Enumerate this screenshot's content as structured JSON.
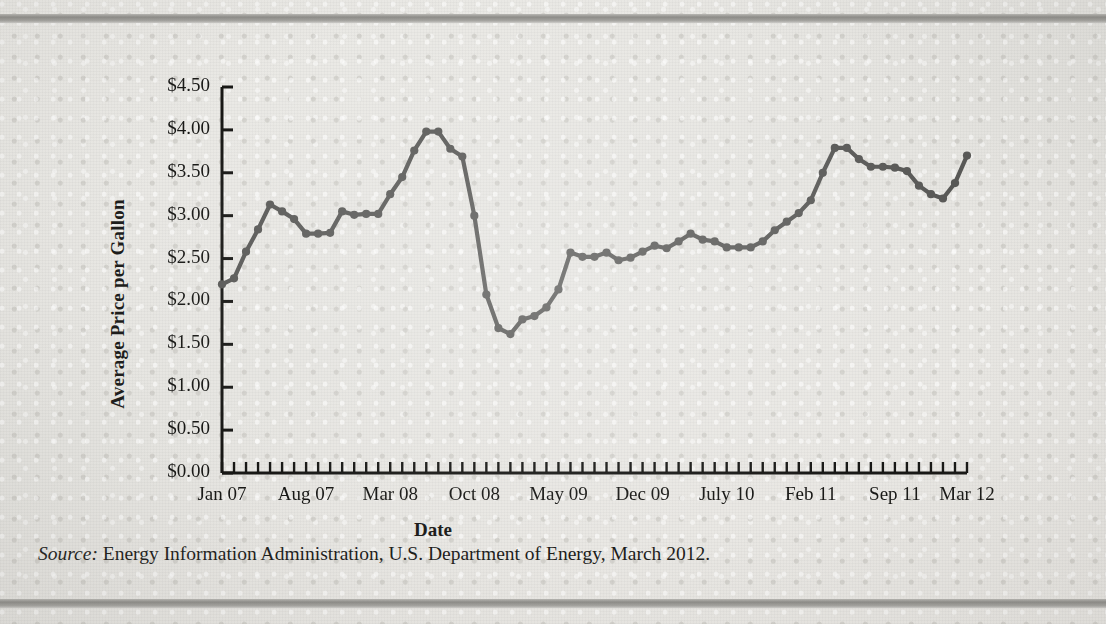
{
  "figure": {
    "ylabel": "Average Price per Gallon",
    "xlabel": "Date",
    "source_prefix": "Source:",
    "source_text": " Energy Information Administration, U.S. Department of Energy, March 2012."
  },
  "colors": {
    "paper": "#e9e8e4",
    "ink": "#1d1d1b",
    "series": "#5a5a58",
    "rule": "#8d8c88"
  },
  "chart_data": {
    "type": "line",
    "title": "",
    "xlabel": "Date",
    "ylabel": "Average Price per Gallon",
    "ylim": [
      0.0,
      4.5
    ],
    "ytick_labels": [
      "$0.00",
      "$0.50",
      "$1.00",
      "$1.50",
      "$2.00",
      "$2.50",
      "$3.00",
      "$3.50",
      "$4.00",
      "$4.50"
    ],
    "ytick_values": [
      0.0,
      0.5,
      1.0,
      1.5,
      2.0,
      2.5,
      3.0,
      3.5,
      4.0,
      4.5
    ],
    "xtick_labels": [
      "Jan 07",
      "Aug 07",
      "Mar 08",
      "Oct 08",
      "May 09",
      "Dec 09",
      "July 10",
      "Feb 11",
      "Sep 11",
      "Mar 12"
    ],
    "xtick_label_indices": [
      0,
      7,
      14,
      21,
      28,
      35,
      42,
      49,
      56,
      62
    ],
    "n_points": 63,
    "minor_ticks": true,
    "grid": false,
    "legend": "none",
    "markers": true,
    "x": [
      "Jan 07",
      "Feb 07",
      "Mar 07",
      "Apr 07",
      "May 07",
      "Jun 07",
      "July 07",
      "Aug 07",
      "Sep 07",
      "Oct 07",
      "Nov 07",
      "Dec 07",
      "Jan 08",
      "Feb 08",
      "Mar 08",
      "Apr 08",
      "May 08",
      "Jun 08",
      "July 08",
      "Aug 08",
      "Sep 08",
      "Oct 08",
      "Nov 08",
      "Dec 08",
      "Jan 09",
      "Feb 09",
      "Mar 09",
      "Apr 09",
      "May 09",
      "Jun 09",
      "July 09",
      "Aug 09",
      "Sep 09",
      "Oct 09",
      "Nov 09",
      "Dec 09",
      "Jan 10",
      "Feb 10",
      "Mar 10",
      "Apr 10",
      "May 10",
      "Jun 10",
      "July 10",
      "Aug 10",
      "Sep 10",
      "Oct 10",
      "Nov 10",
      "Dec 10",
      "Jan 11",
      "Feb 11",
      "Mar 11",
      "Apr 11",
      "May 11",
      "Jun 11",
      "July 11",
      "Aug 11",
      "Sep 11",
      "Oct 11",
      "Nov 11",
      "Dec 11",
      "Jan 12",
      "Feb 12",
      "Mar 12"
    ],
    "values": [
      2.2,
      2.27,
      2.58,
      2.84,
      3.13,
      3.05,
      2.96,
      2.79,
      2.79,
      2.8,
      3.05,
      3.01,
      3.02,
      3.02,
      3.25,
      3.45,
      3.76,
      3.98,
      3.98,
      3.78,
      3.69,
      3.0,
      2.08,
      1.69,
      1.62,
      1.79,
      1.83,
      1.93,
      2.14,
      2.57,
      2.52,
      2.52,
      2.57,
      2.48,
      2.51,
      2.58,
      2.65,
      2.62,
      2.7,
      2.79,
      2.72,
      2.7,
      2.63,
      2.63,
      2.63,
      2.7,
      2.83,
      2.93,
      3.03,
      3.18,
      3.5,
      3.79,
      3.79,
      3.66,
      3.57,
      3.57,
      3.56,
      3.52,
      3.35,
      3.25,
      3.2,
      3.38,
      3.7
    ]
  }
}
